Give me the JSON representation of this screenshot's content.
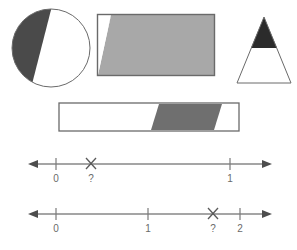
{
  "page": {
    "background_color": "#ffffff",
    "width": 297,
    "height": 250
  },
  "palette": {
    "outline": "#6a6a6a",
    "dark_gray_fill": "#4a4a4a",
    "medium_gray_fill": "#a8a8a8",
    "near_black_fill": "#2b2b2b",
    "white_fill": "#ffffff",
    "axis_color": "#4d4d4d",
    "label_color": "#6a6a6a"
  },
  "figures": [
    {
      "id": "circle",
      "name": "shaded-circle",
      "shape": "circle",
      "outline_color": "#6a6a6a",
      "fill_color": "#4a4a4a",
      "unfilled_color": "#ffffff",
      "shaded_fraction_label": "",
      "description": "Circle with a left-hand segment shaded dark gray, cut by a chord running from the top of the circle down to the lower-left."
    },
    {
      "id": "rectangle",
      "name": "shaded-rectangle",
      "shape": "rectangle",
      "outline_color": "#6a6a6a",
      "fill_color": "#a8a8a8",
      "unfilled_color": "#ffffff",
      "shaded_fraction_label": "",
      "description": "Rectangle almost fully shaded medium gray, with a small white triangle cut from the top-left corner."
    },
    {
      "id": "triangle",
      "name": "shaded-triangle",
      "shape": "triangle",
      "outline_color": "#6a6a6a",
      "fill_color": "#2b2b2b",
      "unfilled_color": "#ffffff",
      "shaded_fraction_label": "",
      "description": "Triangle with the top portion shaded near-black and the lower portion left white."
    },
    {
      "id": "bar",
      "name": "shaded-bar",
      "shape": "bar",
      "outline_color": "#6a6a6a",
      "fill_color": "#6f6f6f",
      "unfilled_color": "#ffffff",
      "shaded_fraction_label": "",
      "description": "Long horizontal bar with a slanted dark gray parallelogram band toward the right end."
    }
  ],
  "number_lines": [
    {
      "id": "numline-1",
      "name": "number-line-zero-to-one",
      "ticks": [
        {
          "label": "0",
          "value": 0
        },
        {
          "label": "1",
          "value": 1
        }
      ],
      "marker": {
        "glyph": "X",
        "label": "?",
        "name": "unknown-point-marker",
        "between": [
          "0",
          "1"
        ],
        "position_note": "just right of 0"
      },
      "arrows": {
        "left": true,
        "right": true
      }
    },
    {
      "id": "numline-2",
      "name": "number-line-zero-to-two",
      "ticks": [
        {
          "label": "0",
          "value": 0
        },
        {
          "label": "1",
          "value": 1
        },
        {
          "label": "2",
          "value": 2
        }
      ],
      "marker": {
        "glyph": "X",
        "label": "?",
        "name": "unknown-point-marker",
        "between": [
          "1",
          "2"
        ],
        "position_note": "just left of 2"
      },
      "arrows": {
        "left": true,
        "right": true
      }
    }
  ]
}
